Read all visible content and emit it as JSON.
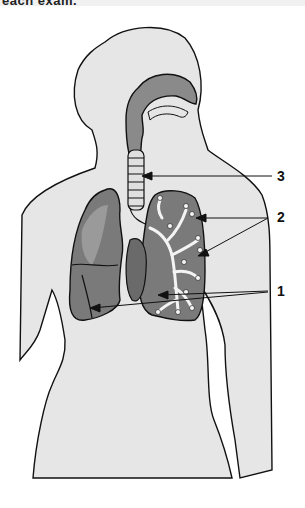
{
  "header": {
    "cropped_text": "each exam."
  },
  "figure": {
    "labels": [
      {
        "id": "3",
        "text": "3",
        "target": "trachea"
      },
      {
        "id": "2",
        "text": "2",
        "target": "bronchioles"
      },
      {
        "id": "1",
        "text": "1",
        "target": "lung lobes"
      }
    ],
    "colors": {
      "body_fill": "#e6e6e6",
      "airway_fill": "#8a8a8a",
      "lung_fill": "#7a7a7a",
      "lung_light": "#9a9a9a",
      "outline": "#111111",
      "bronchi": "#f4f4f4"
    }
  }
}
